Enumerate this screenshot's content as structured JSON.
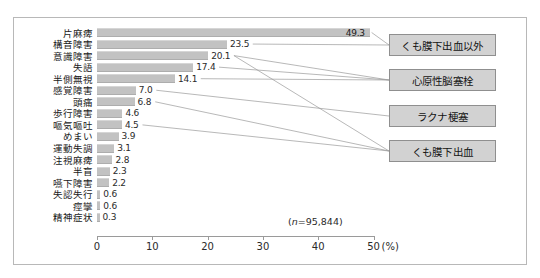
{
  "chart_data": {
    "type": "bar",
    "orientation": "horizontal",
    "title": "",
    "xlabel": "(%)",
    "ylabel": "",
    "xlim": [
      0,
      50
    ],
    "xticks": [
      0,
      10,
      20,
      30,
      40,
      50
    ],
    "xtick_labels": [
      "0",
      "10",
      "20",
      "30",
      "40",
      "50"
    ],
    "unit_label": "(%)",
    "grid": false,
    "legend": "none",
    "annotation": "(n=95,844)",
    "sample_size_prefix": "(",
    "sample_size_italic": "n",
    "sample_size_rest": "=95,844)",
    "bar_color": "#c2c2c2",
    "categories": [
      "片麻痺",
      "構音障害",
      "意識障害",
      "失語",
      "半側無視",
      "感覚障害",
      "頭痛",
      "歩行障害",
      "嘔気嘔吐",
      "めまい",
      "運動失調",
      "注視麻痺",
      "半盲",
      "嚥下障害",
      "失認失行",
      "痙攣",
      "精神症状"
    ],
    "values": [
      49.3,
      23.5,
      20.1,
      17.4,
      14.1,
      7.0,
      6.8,
      4.6,
      4.5,
      3.9,
      3.1,
      2.8,
      2.3,
      2.2,
      0.6,
      0.6,
      0.3
    ],
    "value_labels": [
      "49.3",
      "23.5",
      "20.1",
      "17.4",
      "14.1",
      "7.0",
      "6.8",
      "4.6",
      "4.5",
      "3.9",
      "3.1",
      "2.8",
      "2.3",
      "2.2",
      "0.6",
      "0.6",
      "0.3"
    ],
    "value_label_inside": [
      true,
      false,
      false,
      false,
      false,
      false,
      false,
      false,
      false,
      false,
      false,
      false,
      false,
      false,
      false,
      false,
      false
    ]
  },
  "callouts": [
    {
      "label": "くも膜下出血以外",
      "connects_from": [
        "片麻痺",
        "構音障害"
      ]
    },
    {
      "label": "心原性脳塞栓",
      "connects_from": [
        "意識障害",
        "失語",
        "半側無視"
      ]
    },
    {
      "label": "ラクナ梗塞",
      "connects_from": [
        "感覚障害"
      ]
    },
    {
      "label": "くも膜下出血",
      "connects_from": [
        "意識障害",
        "頭痛",
        "嘔気嘔吐"
      ]
    }
  ],
  "colors": {
    "bar": "#c2c2c2",
    "callout_fill": "#d2d2d2",
    "callout_border": "#8f8f8f",
    "frame_border": "#b8b8b8",
    "connector": "#9a9a9a",
    "axis": "#9a9a9a",
    "text": "#1a1a1a"
  }
}
